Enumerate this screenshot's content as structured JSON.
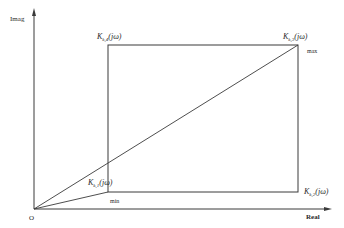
{
  "axes": {
    "y_label": "Imag",
    "x_label": "Real",
    "origin_label": "O"
  },
  "vertices": [
    {
      "id": "k1",
      "base": "K",
      "sub": "k,1",
      "arg": "(jω)",
      "position": "bottom-left"
    },
    {
      "id": "k2",
      "base": "K",
      "sub": "k,2",
      "arg": "(jω)",
      "position": "bottom-right"
    },
    {
      "id": "k3",
      "base": "K",
      "sub": "k,3",
      "arg": "(jω)",
      "position": "top-right"
    },
    {
      "id": "k4",
      "base": "K",
      "sub": "k,4",
      "arg": "(jω)",
      "position": "top-left"
    }
  ],
  "annotations": {
    "max": "max",
    "min": "min"
  },
  "colors": {
    "line": "#3a3a3a",
    "text": "#2a2a2a",
    "background": "#ffffff"
  }
}
